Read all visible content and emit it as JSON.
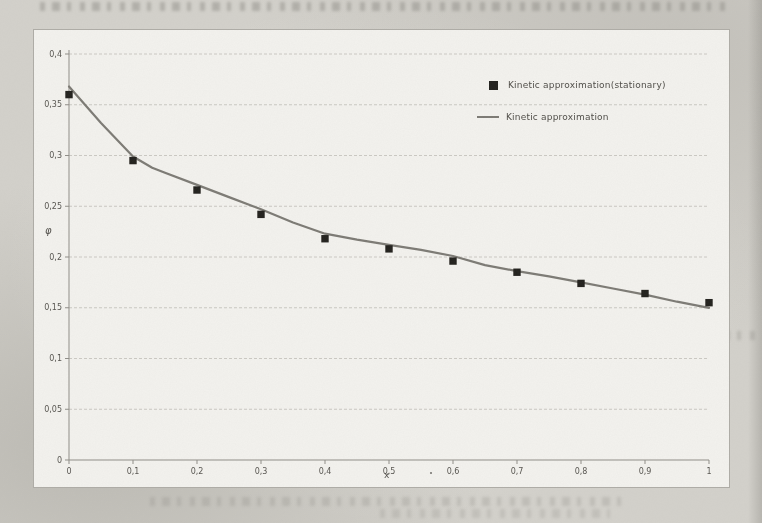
{
  "chart_data": {
    "type": "line",
    "title": "",
    "xlabel": "x",
    "ylabel": "φ",
    "xlim": [
      0,
      1
    ],
    "ylim": [
      0,
      0.4
    ],
    "grid": "horizontal-dashed",
    "legend_position": "upper-right-inside",
    "decimal_separator": ",",
    "x_ticks": [
      {
        "value": 0.0,
        "label": "0"
      },
      {
        "value": 0.1,
        "label": "0,1"
      },
      {
        "value": 0.2,
        "label": "0,2"
      },
      {
        "value": 0.3,
        "label": "0,3"
      },
      {
        "value": 0.4,
        "label": "0,4"
      },
      {
        "value": 0.5,
        "label": "0,5"
      },
      {
        "value": 0.6,
        "label": "0,6"
      },
      {
        "value": 0.7,
        "label": "0,7"
      },
      {
        "value": 0.8,
        "label": "0,8"
      },
      {
        "value": 0.9,
        "label": "0,9"
      },
      {
        "value": 1.0,
        "label": "1"
      }
    ],
    "y_ticks": [
      {
        "value": 0.0,
        "label": "0"
      },
      {
        "value": 0.05,
        "label": "0,05"
      },
      {
        "value": 0.1,
        "label": "0,1"
      },
      {
        "value": 0.15,
        "label": "0,15"
      },
      {
        "value": 0.2,
        "label": "0,2"
      },
      {
        "value": 0.25,
        "label": "0,25"
      },
      {
        "value": 0.3,
        "label": "0,3"
      },
      {
        "value": 0.35,
        "label": "0,35"
      },
      {
        "value": 0.4,
        "label": "0,4"
      }
    ],
    "series": [
      {
        "name": "Kinetic approximation(stationary)",
        "type": "scatter",
        "marker": "square",
        "color": "#21201c",
        "x": [
          0,
          0.1,
          0.2,
          0.3,
          0.4,
          0.5,
          0.6,
          0.7,
          0.8,
          0.9,
          1.0
        ],
        "y": [
          0.36,
          0.295,
          0.266,
          0.242,
          0.218,
          0.208,
          0.196,
          0.185,
          0.174,
          0.164,
          0.155
        ]
      },
      {
        "name": "Kinetic approximation",
        "type": "line",
        "color": "#7c7a74",
        "x": [
          0,
          0.05,
          0.1,
          0.13,
          0.15,
          0.2,
          0.25,
          0.3,
          0.35,
          0.4,
          0.45,
          0.5,
          0.55,
          0.6,
          0.65,
          0.7,
          0.75,
          0.8,
          0.85,
          0.9,
          0.95,
          1.0
        ],
        "y": [
          0.368,
          0.332,
          0.299,
          0.288,
          0.283,
          0.271,
          0.259,
          0.247,
          0.234,
          0.223,
          0.217,
          0.212,
          0.207,
          0.201,
          0.192,
          0.186,
          0.181,
          0.175,
          0.169,
          0.163,
          0.156,
          0.15
        ]
      }
    ],
    "colors": {
      "grid": "#c0beb8",
      "axis": "#8f8d87",
      "tick_text": "#56544f",
      "plot_background": "#f3f2ee",
      "page_background": "#d3d1cb"
    }
  }
}
